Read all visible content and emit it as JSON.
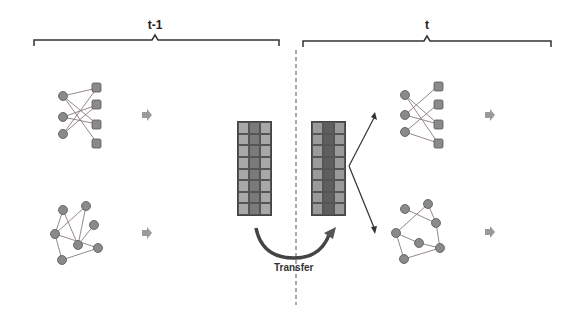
{
  "timesteps": {
    "previous": {
      "label": "t-1"
    },
    "current": {
      "label": "t"
    }
  },
  "left": {
    "user_item_subgraph": {
      "title": "User-Item Subgraph at t-1"
    },
    "item_item_subgraph": {
      "title": "Item-Item Subgraph at t-1"
    },
    "model": {
      "line1": "DCRF",
      "line2": "Model"
    },
    "embedding": {
      "line1": "Trained",
      "line2": "node embedding",
      "line3": "(prior knowledge)"
    }
  },
  "right": {
    "user_item_subgraph": {
      "title": "User-Item Subgraph at t"
    },
    "item_item_subgraph": {
      "title": "Item-Item Subgraph at t"
    },
    "model": {
      "line1": "DCRF",
      "line2": "Model"
    }
  },
  "transfer": {
    "label": "Transfer"
  },
  "colors": {
    "node_fill": "#8a8a8a",
    "node_stroke": "#555555",
    "model_box": "#b4b4b4",
    "embed_panel": "#c9c9c9",
    "subgraph_bg": "#ededed",
    "matrix_light": "#a8a8a8",
    "matrix_dark": "#7a7a7a",
    "matrix_light_new": "#9a9a9a",
    "matrix_dark_new": "#5e5e5e"
  },
  "matrix": {
    "rows": 8,
    "cols": 3
  }
}
